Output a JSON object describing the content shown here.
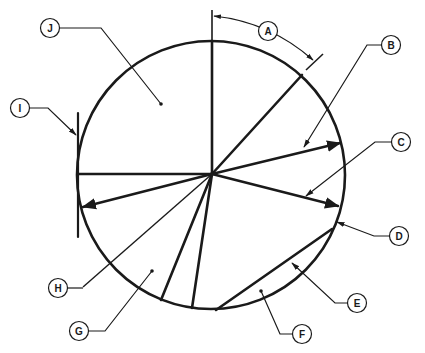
{
  "diagram": {
    "stroke_color": "#1a1a1a",
    "background": "#ffffff",
    "labels": [
      {
        "id": "A",
        "text": "A",
        "meaning": "arc"
      },
      {
        "id": "B",
        "text": "B",
        "meaning": "radius"
      },
      {
        "id": "C",
        "text": "C",
        "meaning": "radius"
      },
      {
        "id": "D",
        "text": "D",
        "meaning": "circumference"
      },
      {
        "id": "E",
        "text": "E",
        "meaning": "chord"
      },
      {
        "id": "F",
        "text": "F",
        "meaning": "segment"
      },
      {
        "id": "G",
        "text": "G",
        "meaning": "sector"
      },
      {
        "id": "H",
        "text": "H",
        "meaning": "center"
      },
      {
        "id": "I",
        "text": "I",
        "meaning": "tangent"
      },
      {
        "id": "J",
        "text": "J",
        "meaning": "quadrant"
      }
    ]
  }
}
